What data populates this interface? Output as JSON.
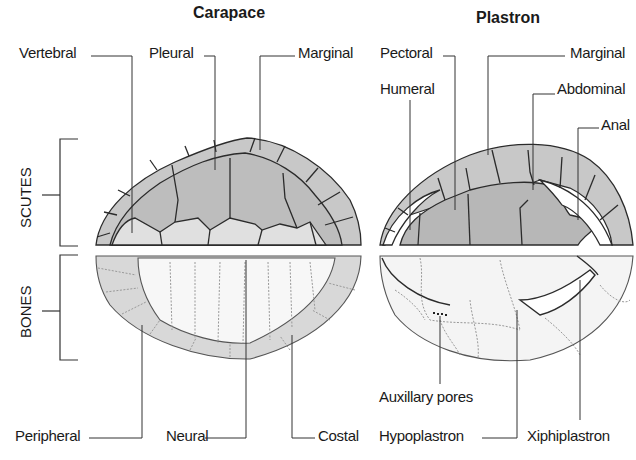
{
  "carapace": {
    "title": "Carapace",
    "scute_labels": [
      "Vertebral",
      "Pleural",
      "Marginal"
    ],
    "bone_labels": [
      "Peripheral",
      "Neural",
      "Costal"
    ]
  },
  "plastron": {
    "title": "Plastron",
    "scute_labels": [
      "Pectoral",
      "Marginal",
      "Humeral",
      "Abdominal",
      "Anal"
    ],
    "bone_labels": [
      "Auxillary pores",
      "Hypoplastron",
      "Xiphiplastron"
    ]
  },
  "row_labels": {
    "scutes": "SCUTES",
    "bones": "BONES"
  },
  "colors": {
    "scute_dark": "#b5b5b5",
    "scute_mid": "#cfcfcf",
    "scute_light": "#e4e4e4",
    "bone_edge": "#d8d8d8",
    "bone_center": "#f6f6f6",
    "line": "#2b2b2b"
  }
}
